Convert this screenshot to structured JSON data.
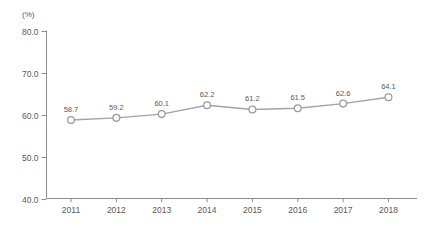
{
  "chart": {
    "unit_label": "(%)",
    "colors": {
      "axis": "#8c8c8c",
      "line": "#a3a3a3",
      "marker_fill": "#ffffff",
      "marker_stroke": "#9c9c9c",
      "label_text": "#595959",
      "tick_text": "#595959",
      "background": "#ffffff"
    }
  },
  "chart_data": {
    "type": "line",
    "x": [
      "2011",
      "2012",
      "2013",
      "2014",
      "2015",
      "2016",
      "2017",
      "2018"
    ],
    "series": [
      {
        "name": "",
        "values": [
          58.7,
          59.2,
          60.1,
          62.2,
          61.2,
          61.5,
          62.6,
          64.1
        ]
      }
    ],
    "data_labels": [
      "58.7",
      "59.2",
      "60.1",
      "62.2",
      "61.2",
      "61.5",
      "62.6",
      "64.1"
    ],
    "title": "",
    "xlabel": "",
    "ylabel": "(%)",
    "ylim": [
      40.0,
      80.0
    ],
    "yticks": [
      40.0,
      50.0,
      60.0,
      70.0,
      80.0
    ],
    "ytick_labels": [
      "40.0",
      "50.0",
      "60.0",
      "70.0",
      "80.0"
    ],
    "grid": false,
    "legend": "none",
    "marker": "open-circle"
  }
}
